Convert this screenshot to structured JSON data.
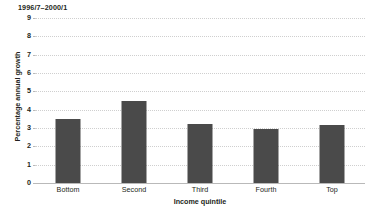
{
  "chart_data": {
    "type": "bar",
    "title": "1996/7–2000/1",
    "xlabel": "Income quintile",
    "ylabel": "Percentage annual growth",
    "categories": [
      "Bottom",
      "Second",
      "Third",
      "Fourth",
      "Top"
    ],
    "values": [
      3.5,
      4.45,
      3.2,
      2.95,
      3.15
    ],
    "ylim": [
      0,
      9
    ],
    "yticks": [
      0,
      1,
      2,
      3,
      4,
      5,
      6,
      7,
      8,
      9
    ],
    "ytick_labels": [
      "0",
      "1",
      "2",
      "3",
      "4",
      "5",
      "6",
      "7",
      "8",
      "9"
    ],
    "grid": true,
    "grid_axis": "y",
    "grid_style": "dotted",
    "legend": false,
    "bar_color": "#4a4a4a",
    "grid_color": "#cfcfcf",
    "axis_color": "#b9b9b9",
    "background": "#ffffff",
    "text_color": "#231f20"
  }
}
